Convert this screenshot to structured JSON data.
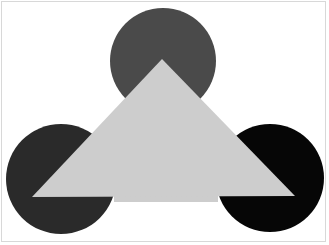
{
  "figure": {
    "background": "#ffffff",
    "frame_color": "#d8d8d8",
    "triangle": {
      "color": "#cdcdcd",
      "points": [
        [
          162,
          59
        ],
        [
          32,
          197
        ],
        [
          295,
          196
        ]
      ],
      "middle_base_y": 202
    },
    "circles": [
      {
        "name": "top",
        "cx": 163,
        "cy": 61,
        "r": 53,
        "color": "#4a4a4a"
      },
      {
        "name": "left",
        "cx": 61,
        "cy": 179,
        "r": 55,
        "color": "#2a2a2a"
      },
      {
        "name": "right",
        "cx": 270,
        "cy": 178,
        "r": 54,
        "color": "#060606"
      }
    ]
  }
}
